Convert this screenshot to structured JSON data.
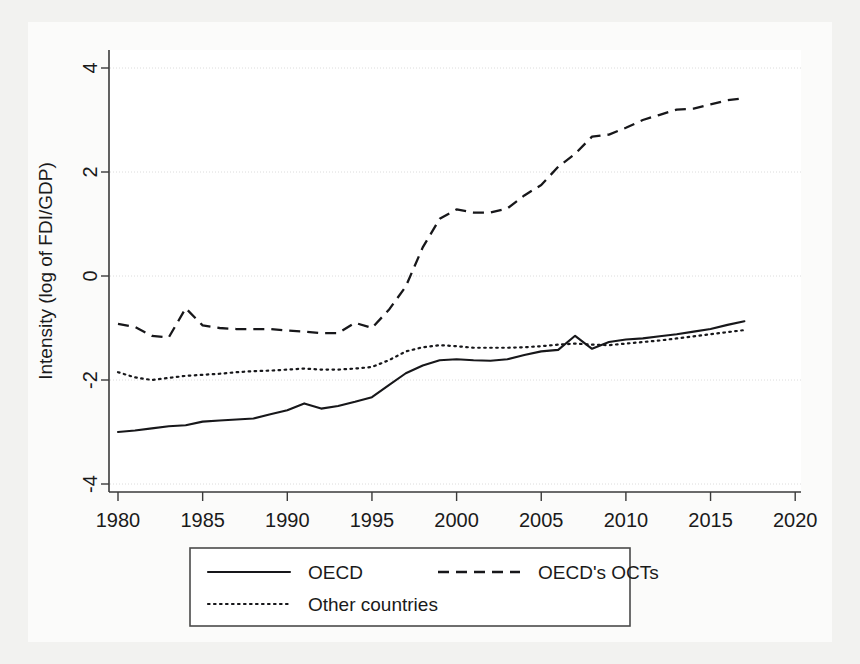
{
  "chart_data": {
    "type": "line",
    "title": "",
    "xlabel": "",
    "ylabel": "Intensity (log of FDI/GDP)",
    "xlim": [
      1979,
      2020.5
    ],
    "ylim": [
      -4.2,
      4.2
    ],
    "xticks": [
      1980,
      1985,
      1990,
      1995,
      2000,
      2005,
      2010,
      2015,
      2020
    ],
    "yticks": [
      -4,
      -2,
      0,
      2,
      4
    ],
    "xtick_labels": [
      "1980",
      "1985",
      "1990",
      "1995",
      "2000",
      "2005",
      "2010",
      "2015",
      "2020"
    ],
    "ytick_labels": [
      "-4",
      "-2",
      "0",
      "2",
      "4"
    ],
    "grid": true,
    "grid_axis": "y",
    "legend_position": "below-center",
    "x": [
      1980,
      1981,
      1982,
      1983,
      1984,
      1985,
      1986,
      1987,
      1988,
      1989,
      1990,
      1991,
      1992,
      1993,
      1994,
      1995,
      1996,
      1997,
      1998,
      1999,
      2000,
      2001,
      2002,
      2003,
      2004,
      2005,
      2006,
      2007,
      2008,
      2009,
      2010,
      2011,
      2012,
      2013,
      2014,
      2015,
      2016,
      2017
    ],
    "series": [
      {
        "name": "OECD",
        "style": "solid",
        "values": [
          -3.0,
          -2.97,
          -2.93,
          -2.89,
          -2.87,
          -2.8,
          -2.78,
          -2.76,
          -2.74,
          -2.66,
          -2.58,
          -2.45,
          -2.55,
          -2.5,
          -2.42,
          -2.33,
          -2.1,
          -1.87,
          -1.72,
          -1.62,
          -1.6,
          -1.62,
          -1.63,
          -1.6,
          -1.52,
          -1.45,
          -1.42,
          -1.15,
          -1.4,
          -1.27,
          -1.22,
          -1.2,
          -1.16,
          -1.12,
          -1.07,
          -1.02,
          -0.94,
          -0.87
        ]
      },
      {
        "name": "OECD's OCTs",
        "style": "dashed",
        "values": [
          -0.92,
          -0.98,
          -1.15,
          -1.18,
          -0.62,
          -0.95,
          -1.0,
          -1.02,
          -1.02,
          -1.02,
          -1.05,
          -1.07,
          -1.1,
          -1.1,
          -0.9,
          -1.0,
          -0.65,
          -0.2,
          0.55,
          1.1,
          1.28,
          1.22,
          1.22,
          1.3,
          1.55,
          1.75,
          2.1,
          2.35,
          2.68,
          2.72,
          2.85,
          3.0,
          3.1,
          3.2,
          3.22,
          3.3,
          3.38,
          3.42
        ]
      },
      {
        "name": "Other countries",
        "style": "dotted",
        "values": [
          -1.85,
          -1.95,
          -2.0,
          -1.96,
          -1.92,
          -1.9,
          -1.88,
          -1.85,
          -1.83,
          -1.82,
          -1.8,
          -1.78,
          -1.8,
          -1.8,
          -1.78,
          -1.75,
          -1.62,
          -1.45,
          -1.37,
          -1.33,
          -1.35,
          -1.38,
          -1.38,
          -1.38,
          -1.37,
          -1.35,
          -1.32,
          -1.3,
          -1.32,
          -1.33,
          -1.3,
          -1.27,
          -1.24,
          -1.2,
          -1.16,
          -1.12,
          -1.08,
          -1.04
        ]
      }
    ],
    "legend": [
      {
        "label": "OECD",
        "style": "solid"
      },
      {
        "label": "OECD's OCTs",
        "style": "dashed"
      },
      {
        "label": "Other countries",
        "style": "dotted"
      }
    ]
  }
}
